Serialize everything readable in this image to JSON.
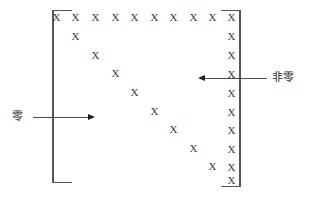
{
  "figure": {
    "marker": "X",
    "colors": {
      "marker": "#3a3a3a",
      "bracket": "#555555",
      "arrow": "#4a4a4a",
      "label": "#2b2b2b",
      "background": "#ffffff"
    }
  },
  "labels": {
    "zero": "零",
    "nonzero": "非零"
  },
  "brackets": {
    "left": {
      "x": 52,
      "y": 10,
      "width": 20,
      "height": 173
    },
    "right": {
      "x": 221,
      "y": 10,
      "width": 20,
      "height": 177
    }
  },
  "arrows": {
    "zero": {
      "label": "零",
      "label_x": 12,
      "label_y": 111,
      "line_x": 33,
      "line_y": 117,
      "line_length": 55,
      "direction": "right",
      "head_x": 88,
      "head_y": 114
    },
    "nonzero": {
      "label": "非零",
      "label_x": 272,
      "label_y": 72,
      "line_x": 205,
      "line_y": 78,
      "line_length": 62,
      "direction": "left",
      "head_x": 198,
      "head_y": 75
    }
  },
  "chart_data": {
    "type": "scatter",
    "xlabel": "",
    "ylabel": "",
    "rows": 10,
    "cols": 10,
    "legend": [
      "零",
      "非零"
    ],
    "series": [
      {
        "name": "top-row",
        "marker": "X",
        "points": [
          {
            "x": 56,
            "y": 18
          },
          {
            "x": 75,
            "y": 18
          },
          {
            "x": 95,
            "y": 18
          },
          {
            "x": 115,
            "y": 18
          },
          {
            "x": 134,
            "y": 18
          },
          {
            "x": 154,
            "y": 18
          },
          {
            "x": 173,
            "y": 18
          },
          {
            "x": 193,
            "y": 18
          },
          {
            "x": 212,
            "y": 18
          },
          {
            "x": 231,
            "y": 18
          }
        ]
      },
      {
        "name": "right-column",
        "marker": "X",
        "points": [
          {
            "x": 231,
            "y": 18
          },
          {
            "x": 231,
            "y": 37
          },
          {
            "x": 231,
            "y": 56
          },
          {
            "x": 231,
            "y": 75
          },
          {
            "x": 231,
            "y": 94
          },
          {
            "x": 231,
            "y": 113
          },
          {
            "x": 231,
            "y": 131
          },
          {
            "x": 231,
            "y": 150
          },
          {
            "x": 231,
            "y": 168
          },
          {
            "x": 231,
            "y": 181
          }
        ]
      },
      {
        "name": "diagonal",
        "marker": "X",
        "points": [
          {
            "x": 75,
            "y": 37
          },
          {
            "x": 95,
            "y": 56
          },
          {
            "x": 115,
            "y": 74
          },
          {
            "x": 134,
            "y": 93
          },
          {
            "x": 154,
            "y": 112
          },
          {
            "x": 173,
            "y": 130
          },
          {
            "x": 193,
            "y": 149
          },
          {
            "x": 212,
            "y": 167
          }
        ]
      }
    ]
  }
}
